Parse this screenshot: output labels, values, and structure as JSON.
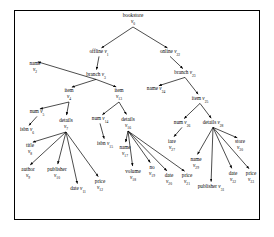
{
  "figure": {
    "type": "tree-diagram",
    "border_color": "#000000",
    "background": "#ffffff",
    "text_color": "#000000"
  },
  "nodes": [
    {
      "id": "v0",
      "label": "bookstore",
      "vid": "v",
      "sub": "0",
      "x": 133,
      "y": 20,
      "layout": "stack"
    },
    {
      "id": "v1",
      "label": "offline",
      "vid": "v",
      "sub": "1",
      "x": 99,
      "y": 53,
      "layout": "inline"
    },
    {
      "id": "v22",
      "label": "online",
      "vid": "v",
      "sub": "22",
      "x": 170,
      "y": 53,
      "layout": "inline"
    },
    {
      "id": "v2",
      "label": "name",
      "vid": "v",
      "sub": "2",
      "x": 35,
      "y": 68,
      "layout": "stack"
    },
    {
      "id": "v3",
      "label": "branch",
      "vid": "v",
      "sub": "3",
      "x": 96,
      "y": 76,
      "layout": "inline"
    },
    {
      "id": "v23",
      "label": "branch",
      "vid": "v",
      "sub": "23",
      "x": 185,
      "y": 74,
      "layout": "inline"
    },
    {
      "id": "v4",
      "label": "item",
      "vid": "v",
      "sub": "4",
      "x": 69,
      "y": 95,
      "layout": "stack"
    },
    {
      "id": "v13",
      "label": "item",
      "vid": "v",
      "sub": "13",
      "x": 119,
      "y": 95,
      "layout": "stack"
    },
    {
      "id": "v24",
      "label": "name",
      "vid": "v",
      "sub": "24",
      "x": 156,
      "y": 90,
      "layout": "inline"
    },
    {
      "id": "v25",
      "label": "item",
      "vid": "v",
      "sub": "25",
      "x": 200,
      "y": 100,
      "layout": "inline"
    },
    {
      "id": "v5",
      "label": "num",
      "vid": "v",
      "sub": "5",
      "x": 37,
      "y": 113,
      "layout": "inline"
    },
    {
      "id": "v7",
      "label": "details",
      "vid": "v",
      "sub": "7",
      "x": 66,
      "y": 125,
      "layout": "stack"
    },
    {
      "id": "v6",
      "label": "isbn",
      "vid": "v",
      "sub": "6",
      "x": 27,
      "y": 131,
      "layout": "inline"
    },
    {
      "id": "v14",
      "label": "num",
      "vid": "v",
      "sub": "14",
      "x": 100,
      "y": 120,
      "layout": "inline"
    },
    {
      "id": "v16",
      "label": "details",
      "vid": "v",
      "sub": "16",
      "x": 128,
      "y": 124,
      "layout": "stack"
    },
    {
      "id": "v26",
      "label": "num",
      "vid": "v",
      "sub": "26",
      "x": 182,
      "y": 124,
      "layout": "inline"
    },
    {
      "id": "v28",
      "label": "details",
      "vid": "v",
      "sub": "28",
      "x": 213,
      "y": 124,
      "layout": "inline"
    },
    {
      "id": "v8",
      "label": "title",
      "vid": "v",
      "sub": "8",
      "x": 30,
      "y": 150,
      "layout": "stack"
    },
    {
      "id": "v15",
      "label": "isbn",
      "vid": "v",
      "sub": "15",
      "x": 105,
      "y": 145,
      "layout": "inline"
    },
    {
      "id": "v27",
      "label": "iare",
      "vid": "v",
      "sub": "27",
      "x": 172,
      "y": 146,
      "layout": "stack"
    },
    {
      "id": "v30",
      "label": "store",
      "vid": "v",
      "sub": "30",
      "x": 240,
      "y": 146,
      "layout": "stack"
    },
    {
      "id": "v17",
      "label": "name",
      "vid": "v",
      "sub": "17",
      "x": 125,
      "y": 152,
      "layout": "stack"
    },
    {
      "id": "v29",
      "label": "name",
      "vid": "v",
      "sub": "29",
      "x": 196,
      "y": 164,
      "layout": "stack"
    },
    {
      "id": "v9",
      "label": "author",
      "vid": "v",
      "sub": "9",
      "x": 28,
      "y": 174,
      "layout": "stack"
    },
    {
      "id": "v10",
      "label": "publisher",
      "vid": "v",
      "sub": "10",
      "x": 57,
      "y": 174,
      "layout": "stack"
    },
    {
      "id": "v11",
      "label": "date",
      "vid": "v",
      "sub": "11",
      "x": 78,
      "y": 190,
      "layout": "inline"
    },
    {
      "id": "v12",
      "label": "price",
      "vid": "v",
      "sub": "12",
      "x": 100,
      "y": 186,
      "layout": "stack"
    },
    {
      "id": "v18",
      "label": "volume",
      "vid": "v",
      "sub": "18",
      "x": 133,
      "y": 176,
      "layout": "stack"
    },
    {
      "id": "v19",
      "label": "no",
      "vid": "v",
      "sub": "19",
      "x": 152,
      "y": 172,
      "layout": "stack"
    },
    {
      "id": "v20",
      "label": "date",
      "vid": "v",
      "sub": "20",
      "x": 169,
      "y": 180,
      "layout": "stack"
    },
    {
      "id": "v21",
      "label": "price",
      "vid": "v",
      "sub": "21",
      "x": 187,
      "y": 180,
      "layout": "stack"
    },
    {
      "id": "v31",
      "label": "publisher",
      "vid": "v",
      "sub": "31",
      "x": 211,
      "y": 188,
      "layout": "inline"
    },
    {
      "id": "v32",
      "label": "date",
      "vid": "v",
      "sub": "32",
      "x": 233,
      "y": 178,
      "layout": "stack"
    },
    {
      "id": "v33",
      "label": "price",
      "vid": "v",
      "sub": "33",
      "x": 251,
      "y": 178,
      "layout": "stack"
    }
  ],
  "edges": [
    {
      "from": "v0",
      "to": "v1"
    },
    {
      "from": "v0",
      "to": "v22"
    },
    {
      "from": "v1",
      "to": "v3"
    },
    {
      "from": "v3",
      "to": "v2"
    },
    {
      "from": "v3",
      "to": "v4"
    },
    {
      "from": "v3",
      "to": "v13"
    },
    {
      "from": "v22",
      "to": "v23"
    },
    {
      "from": "v23",
      "to": "v24"
    },
    {
      "from": "v23",
      "to": "v25"
    },
    {
      "from": "v4",
      "to": "v5"
    },
    {
      "from": "v4",
      "to": "v7"
    },
    {
      "from": "v5",
      "to": "v6"
    },
    {
      "from": "v13",
      "to": "v14"
    },
    {
      "from": "v13",
      "to": "v16"
    },
    {
      "from": "v14",
      "to": "v15"
    },
    {
      "from": "v25",
      "to": "v26"
    },
    {
      "from": "v25",
      "to": "v28"
    },
    {
      "from": "v26",
      "to": "v27"
    },
    {
      "from": "v7",
      "to": "v8"
    },
    {
      "from": "v7",
      "to": "v9"
    },
    {
      "from": "v7",
      "to": "v10"
    },
    {
      "from": "v7",
      "to": "v11"
    },
    {
      "from": "v7",
      "to": "v12"
    },
    {
      "from": "v16",
      "to": "v17"
    },
    {
      "from": "v16",
      "to": "v18"
    },
    {
      "from": "v16",
      "to": "v19"
    },
    {
      "from": "v16",
      "to": "v20"
    },
    {
      "from": "v16",
      "to": "v21"
    },
    {
      "from": "v28",
      "to": "v29"
    },
    {
      "from": "v28",
      "to": "v30"
    },
    {
      "from": "v28",
      "to": "v31"
    },
    {
      "from": "v28",
      "to": "v32"
    },
    {
      "from": "v28",
      "to": "v33"
    }
  ]
}
